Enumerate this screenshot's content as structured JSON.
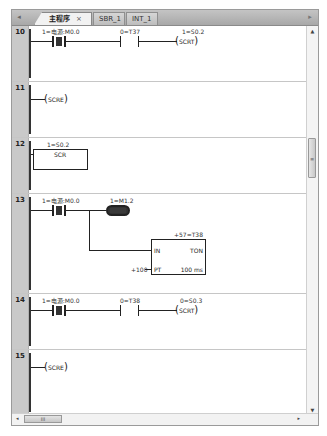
{
  "tabs": {
    "nav_left": "◂",
    "nav_right": "▸",
    "items": [
      {
        "label": "主程序",
        "close": "×",
        "active": true
      },
      {
        "label": "SBR_1",
        "active": false
      },
      {
        "label": "INT_1",
        "active": false
      }
    ]
  },
  "rungs": [
    {
      "number": "10",
      "contact1": {
        "label": "1=电源:M0.0",
        "state": "on"
      },
      "contact2": {
        "label": "0=T37",
        "state": "off"
      },
      "coil": {
        "label": "1=S0.2",
        "text": "SCRT"
      }
    },
    {
      "number": "11",
      "coil": {
        "text": "SCRE"
      }
    },
    {
      "number": "12",
      "box": {
        "label": "1=S0.2",
        "text": "SCR"
      }
    },
    {
      "number": "13",
      "contact1": {
        "label": "1=电源:M0.0",
        "state": "on"
      },
      "coil": {
        "label": "1=M1.2",
        "state": "on"
      },
      "timer": {
        "label": "+57=T38",
        "in": "IN",
        "type": "TON",
        "pt": "PT",
        "pt_value": "+100",
        "base": "100 ms"
      }
    },
    {
      "number": "14",
      "contact1": {
        "label": "1=电源:M0.0",
        "state": "on"
      },
      "contact2": {
        "label": "0=T38",
        "state": "off"
      },
      "coil": {
        "label": "0=S0.3",
        "text": "SCRT"
      }
    },
    {
      "number": "15",
      "coil": {
        "text": "SCRE"
      }
    }
  ],
  "scrollbar": {
    "up": "▲",
    "down": "▼",
    "thumb_grip": "≡",
    "left": "◂",
    "right": "▸",
    "h_thumb_grip": "III"
  }
}
